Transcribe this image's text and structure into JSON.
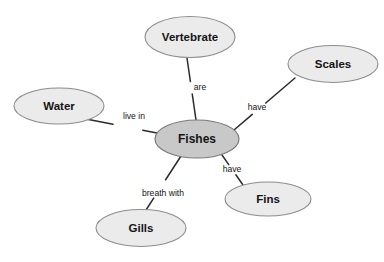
{
  "diagram": {
    "type": "concept-map",
    "background_color": "#ffffff",
    "node_fill_outer": "#ebebeb",
    "node_fill_central": "#c8c8c8",
    "node_stroke": "#8d8d8d",
    "edge_stroke": "#2b2b2b",
    "text_color": "#141414",
    "nodes": [
      {
        "id": "vertebrate",
        "label": "Vertebrate",
        "role": "outer",
        "cx": 190,
        "cy": 37,
        "rx": 45,
        "ry": 20.5,
        "fill": "#ebebeb"
      },
      {
        "id": "scales",
        "label": "Scales",
        "role": "outer",
        "cx": 333,
        "cy": 64,
        "rx": 45,
        "ry": 18.5,
        "fill": "#ebebeb"
      },
      {
        "id": "water",
        "label": "Water",
        "role": "outer",
        "cx": 59,
        "cy": 106,
        "rx": 45,
        "ry": 18,
        "fill": "#ebebeb"
      },
      {
        "id": "fishes",
        "label": "Fishes",
        "role": "central",
        "cx": 197,
        "cy": 139,
        "rx": 42,
        "ry": 19,
        "fill": "#c8c8c8"
      },
      {
        "id": "fins",
        "label": "Fins",
        "role": "outer",
        "cx": 268,
        "cy": 199,
        "rx": 43,
        "ry": 17,
        "fill": "#ebebeb"
      },
      {
        "id": "gills",
        "label": "Gills",
        "role": "outer",
        "cx": 141,
        "cy": 228,
        "rx": 45,
        "ry": 18.5,
        "fill": "#ebebeb"
      }
    ],
    "edges": [
      {
        "id": "edge-fishes-vertebrate",
        "from": "fishes",
        "to": "vertebrate",
        "label": "are",
        "label_x": 200,
        "label_y": 88,
        "x1": 196,
        "y1": 120,
        "x2": 187,
        "y2": 58,
        "gap_from": 0.42,
        "gap_to": 0.62
      },
      {
        "id": "edge-fishes-scales",
        "from": "fishes",
        "to": "scales",
        "label": "have",
        "label_x": 257,
        "label_y": 108,
        "x1": 234,
        "y1": 130,
        "x2": 295,
        "y2": 78,
        "gap_from": 0.3,
        "gap_to": 0.52
      },
      {
        "id": "edge-fishes-water",
        "from": "fishes",
        "to": "water",
        "label": "live in",
        "label_x": 134,
        "label_y": 117,
        "x1": 157,
        "y1": 133,
        "x2": 86,
        "y2": 119,
        "gap_from": 0.2,
        "gap_to": 0.62
      },
      {
        "id": "edge-fishes-fins",
        "from": "fishes",
        "to": "fins",
        "label": "have",
        "label_x": 232,
        "label_y": 170,
        "x1": 222,
        "y1": 155,
        "x2": 243,
        "y2": 185,
        "gap_from": 0.32,
        "gap_to": 0.66
      },
      {
        "id": "edge-fishes-gills",
        "from": "fishes",
        "to": "gills",
        "label": "breath with",
        "label_x": 163,
        "label_y": 194,
        "x1": 181,
        "y1": 156,
        "x2": 146,
        "y2": 210,
        "gap_from": 0.44,
        "gap_to": 0.78
      }
    ]
  }
}
